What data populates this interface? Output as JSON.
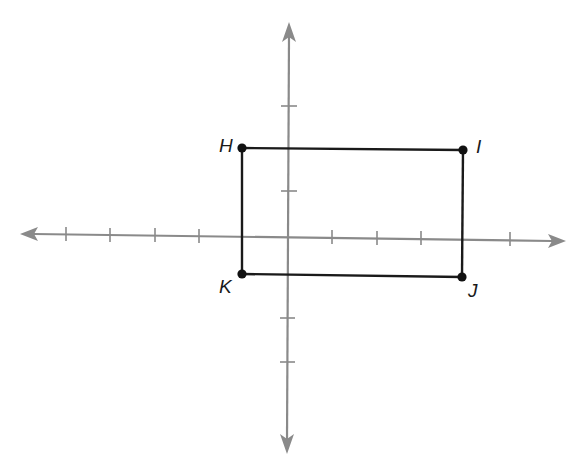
{
  "diagram": {
    "type": "coordinate-plane",
    "origin_px": [
      288,
      236
    ],
    "unit_px": 44.4,
    "x_ticks": [
      -5,
      -4,
      -3,
      -2,
      -1,
      1,
      2,
      3,
      4,
      5
    ],
    "y_ticks": [
      -3,
      -2,
      -1,
      1,
      2,
      3
    ],
    "colors": {
      "axis": "#8a8a8a",
      "rectangle": "#1a1a1a",
      "vertex": "#111111",
      "label": "#1a1a1a"
    },
    "rectangle": {
      "name": "HIJK",
      "vertices": [
        {
          "label": "H",
          "x": -1,
          "y": 2
        },
        {
          "label": "I",
          "x": 4,
          "y": 2
        },
        {
          "label": "J",
          "x": 4,
          "y": -1
        },
        {
          "label": "K",
          "x": -1,
          "y": -1
        }
      ]
    }
  },
  "labels": {
    "H": "H",
    "I": "I",
    "J": "J",
    "K": "K"
  }
}
